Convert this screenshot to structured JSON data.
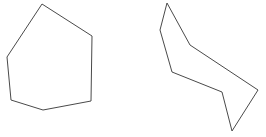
{
  "canvas": {
    "width": 266,
    "height": 137,
    "background_color": "#ffffff",
    "stroke_color": "#4a4a4a",
    "stroke_width": 1
  },
  "shapes": [
    {
      "name": "left-polygon",
      "description": "convex hexagon",
      "sides": 6,
      "points": "42,4 92,36 91,101 43,110 11,100 7,57"
    },
    {
      "name": "right-polygon",
      "description": "concave zigzag arrow polygon",
      "sides": 7,
      "points": "167,3 190,45 258,90 232,131 222,92 172,72 160,30"
    }
  ]
}
